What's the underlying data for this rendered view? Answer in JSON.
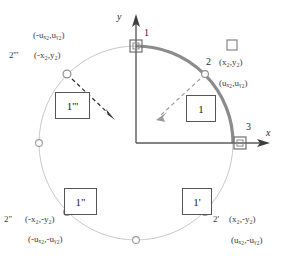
{
  "figure": {
    "axes": {
      "x_label": "x",
      "y_label": "y"
    },
    "nodes": [
      {
        "id": "node-1",
        "number": "1",
        "marker": "square",
        "angle_deg": 90
      },
      {
        "id": "node-2",
        "number": "2",
        "marker": "square-legend",
        "angle_deg": 45
      },
      {
        "id": "node-3",
        "number": "3",
        "marker": "square",
        "angle_deg": 0
      }
    ],
    "node_labels": {
      "n1": "1",
      "n2": "2",
      "n3": "3",
      "n2_coord": "(x₂,y₂)",
      "n2_disp": "(uₓ₂,uᵧ₂)",
      "n2p": "2'",
      "n2p_coord": "(x₂,-y₂)",
      "n2p_disp": "(uₓ₂,-uᵧ₂)",
      "n2pp": "2\"",
      "n2pp_coord": "(-x₂,-y₂)",
      "n2pp_disp": "(-uₓ₂,-uᵧ₂)",
      "n2ppp": "2'''",
      "n2ppp_coord": "(-x₂,y₂)",
      "n2ppp_disp": "(-uₓ₂,uᵧ₂)"
    },
    "element_boxes": [
      {
        "id": "box-1",
        "label": "1",
        "quadrant": "I"
      },
      {
        "id": "box-1-prime",
        "label": "1'",
        "quadrant": "IV"
      },
      {
        "id": "box-1-double-prime",
        "label": "1\"",
        "quadrant": "III"
      },
      {
        "id": "box-1-triple-prime",
        "label": "1'''",
        "quadrant": "II"
      }
    ],
    "arrows": [
      {
        "id": "arrow-1",
        "from": "arc-point-2",
        "direction": "inward-down-left",
        "style": "dashed"
      },
      {
        "id": "arrow-1-triple-prime",
        "from": "circle-point-2ppp",
        "direction": "outward-down-right",
        "style": "dashed"
      }
    ],
    "colors": {
      "arc": "#8c8c8c",
      "circle": "#c9c9c9",
      "axis": "#555555",
      "text": "#333333",
      "box_border": "#555555",
      "marker": "#777777",
      "background": "#ffffff"
    },
    "geometry": {
      "center_x": 136,
      "center_y": 143,
      "radius": 97,
      "arc_start_deg": 0,
      "arc_end_deg": 90
    }
  }
}
